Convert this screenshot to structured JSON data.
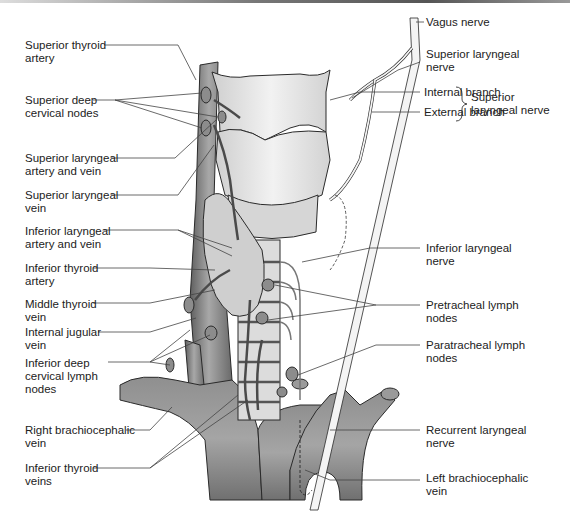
{
  "figure": {
    "colors": {
      "vessel": "#8a8a8a",
      "vessel_dark": "#5e5e5e",
      "cartilage": "#e6e6e6",
      "gland": "#d0d0d0",
      "nerve": "#f4f4f4",
      "outline": "#2a2a2a",
      "leader": "#444444"
    }
  },
  "labels_left": [
    {
      "id": "superior-thyroid-artery",
      "text": "Superior thyroid\nartery"
    },
    {
      "id": "superior-deep-cervical-nodes",
      "text": "Superior deep\ncervical nodes"
    },
    {
      "id": "superior-laryngeal-artery-vein",
      "text": "Superior laryngeal\nartery and vein"
    },
    {
      "id": "superior-laryngeal-vein",
      "text": "Superior laryngeal\nvein"
    },
    {
      "id": "inferior-laryngeal-artery-vein",
      "text": "Inferior laryngeal\nartery and vein"
    },
    {
      "id": "inferior-thyroid-artery",
      "text": "Inferior thyroid\nartery"
    },
    {
      "id": "middle-thyroid-vein",
      "text": "Middle thyroid\nvein"
    },
    {
      "id": "internal-jugular-vein",
      "text": "Internal jugular\nvein"
    },
    {
      "id": "inferior-deep-cervical-lymph-nodes",
      "text": "Inferior deep\ncervical lymph\nnodes"
    },
    {
      "id": "right-brachiocephalic-vein",
      "text": "Right brachiocephalic\nvein"
    },
    {
      "id": "inferior-thyroid-veins",
      "text": "Inferior thyroid\nveins"
    }
  ],
  "labels_right": [
    {
      "id": "vagus-nerve",
      "text": "Vagus nerve"
    },
    {
      "id": "superior-laryngeal-nerve",
      "text": "Superior laryngeal\nnerve"
    },
    {
      "id": "internal-branch",
      "text": "Internal branch"
    },
    {
      "id": "external-branch",
      "text": "External branch"
    },
    {
      "id": "superior-laryngeal-nerve-group",
      "text": "Superior\nlaryngeal nerve"
    },
    {
      "id": "inferior-laryngeal-nerve",
      "text": "Inferior laryngeal\nnerve"
    },
    {
      "id": "pretracheal-lymph-nodes",
      "text": "Pretracheal lymph\nnodes"
    },
    {
      "id": "paratracheal-lymph-nodes",
      "text": "Paratracheal lymph\nnodes"
    },
    {
      "id": "recurrent-laryngeal-nerve",
      "text": "Recurrent laryngeal\nnerve"
    },
    {
      "id": "left-brachiocephalic-vein",
      "text": "Left brachiocephalic\nvein"
    }
  ]
}
